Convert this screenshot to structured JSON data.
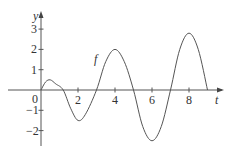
{
  "chart_data": {
    "type": "line",
    "title": "",
    "xlabel": "t",
    "ylabel": "y",
    "curve_label": "f",
    "xlim": [
      0,
      9.5
    ],
    "ylim": [
      -2.7,
      3.6
    ],
    "x_ticks": [
      2,
      4,
      6,
      8
    ],
    "x_tick_labels": [
      "2",
      "4",
      "6",
      "8"
    ],
    "y_ticks": [
      -2,
      -1,
      1,
      2,
      3
    ],
    "y_tick_labels": [
      "-2",
      "-1",
      "1",
      "2",
      "3"
    ],
    "origin_label": "0",
    "grid": false,
    "legend": "none",
    "series": [
      {
        "name": "f",
        "x": [
          0,
          0.25,
          0.5,
          0.8,
          1.2,
          1.6,
          2.0,
          2.4,
          3.0,
          3.5,
          4.0,
          4.5,
          5.0,
          5.5,
          6.0,
          6.5,
          7.0,
          7.5,
          8.0,
          8.5,
          9.0
        ],
        "y": [
          0,
          0.4,
          0.5,
          0.3,
          0,
          -0.9,
          -1.5,
          -1.2,
          0,
          1.4,
          2.0,
          1.4,
          0,
          -1.8,
          -2.5,
          -1.8,
          0,
          2.0,
          2.8,
          2.0,
          0
        ]
      }
    ],
    "color": "#555555"
  }
}
